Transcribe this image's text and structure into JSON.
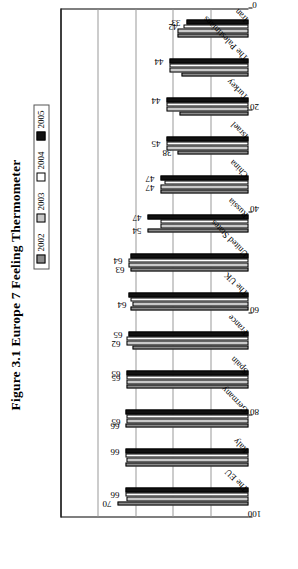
{
  "figure": {
    "title": "Figure 3.1 Europe 7 Feeling Thermometer"
  },
  "legend": {
    "items": [
      {
        "label": "2002",
        "color": "#8b8b8b",
        "swatch": "dark-gray-square"
      },
      {
        "label": "2003",
        "color": "#c9c9c9",
        "swatch": "light-gray-square"
      },
      {
        "label": "2004",
        "color": "#ffffff",
        "swatch": "white-square"
      },
      {
        "label": "2005",
        "color": "#111111",
        "swatch": "black-square"
      }
    ]
  },
  "axis": {
    "value_ticks": [
      "0",
      "20",
      "40",
      "60",
      "80",
      "100"
    ],
    "value_min": 0,
    "value_max": 100
  },
  "chart_data": {
    "type": "bar",
    "title": "Figure 3.1 Europe 7 Feeling Thermometer",
    "xlabel": "",
    "ylabel": "",
    "ylim": [
      0,
      100
    ],
    "grid": true,
    "orientation": "horizontal",
    "legend_position": "top",
    "categories": [
      "The EU",
      "Italy",
      "Germany",
      "Spain",
      "France",
      "The UK",
      "United States",
      "Russia",
      "China",
      "Israel",
      "Turkey",
      "The Palestinians",
      "Iran"
    ],
    "series": [
      {
        "name": "2002",
        "color": "#8b8b8b",
        "values": [
          70,
          66,
          66,
          65,
          62,
          63,
          63,
          54,
          47,
          38,
          37,
          36,
          38
        ]
      },
      {
        "name": "2003",
        "color": "#c9c9c9",
        "values": [
          65,
          65,
          65,
          65,
          65,
          62,
          64,
          47,
          47,
          44,
          44,
          42,
          38
        ]
      },
      {
        "name": "2004",
        "color": "#ffffff",
        "values": [
          66,
          66,
          65,
          65,
          65,
          63,
          64,
          47,
          45,
          44,
          44,
          42,
          35
        ]
      },
      {
        "name": "2005",
        "color": "#111111",
        "values": [
          66,
          66,
          66,
          65,
          64,
          64,
          63,
          54,
          47,
          44,
          44,
          42,
          33
        ]
      }
    ],
    "data_labels": [
      {
        "category": "The EU",
        "series": "2002",
        "value": "70"
      },
      {
        "category": "The EU",
        "series": "2004",
        "value": "66"
      },
      {
        "category": "Italy",
        "series": "2005",
        "value": "66"
      },
      {
        "category": "Germany",
        "series": "2002",
        "value": "66"
      },
      {
        "category": "Germany",
        "series": "2003",
        "value": "65"
      },
      {
        "category": "Spain",
        "series": "2004",
        "value": "65"
      },
      {
        "category": "Spain",
        "series": "2005",
        "value": "65"
      },
      {
        "category": "France",
        "series": "2003",
        "value": "62"
      },
      {
        "category": "France",
        "series": "2005",
        "value": "65"
      },
      {
        "category": "The UK",
        "series": "2003",
        "value": "64"
      },
      {
        "category": "United States",
        "series": "2002",
        "value": "63"
      },
      {
        "category": "United States",
        "series": "2004",
        "value": "64"
      },
      {
        "category": "Russia",
        "series": "2002",
        "value": "54"
      },
      {
        "category": "Russia",
        "series": "2005",
        "value": "47"
      },
      {
        "category": "China",
        "series": "2003",
        "value": "47"
      },
      {
        "category": "China",
        "series": "2005",
        "value": "47"
      },
      {
        "category": "Israel",
        "series": "2002",
        "value": "38"
      },
      {
        "category": "Israel",
        "series": "2004",
        "value": "45"
      },
      {
        "category": "Turkey",
        "series": "2005",
        "value": "44"
      },
      {
        "category": "The Palestinians",
        "series": "2005",
        "value": "44"
      },
      {
        "category": "Iran",
        "series": "2004",
        "value": "42"
      },
      {
        "category": "Iran",
        "series": "2005",
        "value": "33"
      }
    ]
  }
}
